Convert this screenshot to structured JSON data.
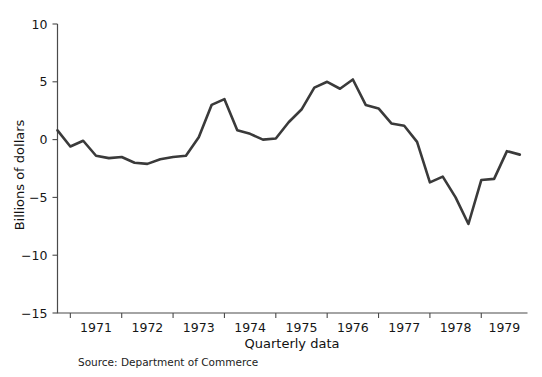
{
  "chart_data": {
    "type": "line",
    "title": "",
    "subtitle": "",
    "xlabel": "Quarterly data",
    "ylabel": "Billions of dollars",
    "ylim": [
      -15,
      10
    ],
    "xlim": [
      1970.75,
      1979.9
    ],
    "yticks": [
      10,
      5,
      0,
      -5,
      -10,
      -15
    ],
    "ytick_labels": [
      "10",
      "5",
      "0",
      "−5",
      "−10",
      "−15"
    ],
    "xticks": [
      1971,
      1972,
      1973,
      1974,
      1975,
      1976,
      1977,
      1978,
      1979,
      1980
    ],
    "xtick_labels": [
      "1971",
      "1972",
      "1973",
      "1974",
      "1975",
      "1976",
      "1977",
      "1978",
      "1979"
    ],
    "grid": false,
    "legend": false,
    "legend_position": "none",
    "line_color": "#3a3a3a",
    "axis_color": "#4a4a4a",
    "background_color": "#ffffff",
    "annotations": [
      {
        "name": "source-note",
        "text": "Source: Department of Commerce"
      }
    ],
    "series": [
      {
        "name": "Federal budget surplus or deficit",
        "x": [
          1970.75,
          1971.0,
          1971.25,
          1971.5,
          1971.75,
          1972.0,
          1972.25,
          1972.5,
          1972.75,
          1973.0,
          1973.25,
          1973.5,
          1973.75,
          1974.0,
          1974.25,
          1974.5,
          1974.75,
          1975.0,
          1975.25,
          1975.5,
          1975.75,
          1976.0,
          1976.25,
          1976.5,
          1976.75,
          1977.0,
          1977.25,
          1977.5,
          1977.75,
          1978.0,
          1978.25,
          1978.5,
          1978.75,
          1979.0,
          1979.25,
          1979.5,
          1979.75
        ],
        "y": [
          0.8,
          -0.6,
          -0.1,
          -1.4,
          -1.6,
          -1.5,
          -2.0,
          -2.1,
          -1.7,
          -1.5,
          -1.4,
          0.2,
          3.0,
          3.5,
          0.8,
          0.5,
          0.0,
          0.1,
          1.5,
          2.6,
          4.5,
          5.0,
          4.4,
          5.2,
          3.0,
          2.7,
          1.4,
          1.2,
          -0.2,
          -3.7,
          -3.2,
          -5.0,
          -7.3,
          -3.5,
          -3.4,
          -1.0,
          -1.3
        ]
      }
    ]
  }
}
